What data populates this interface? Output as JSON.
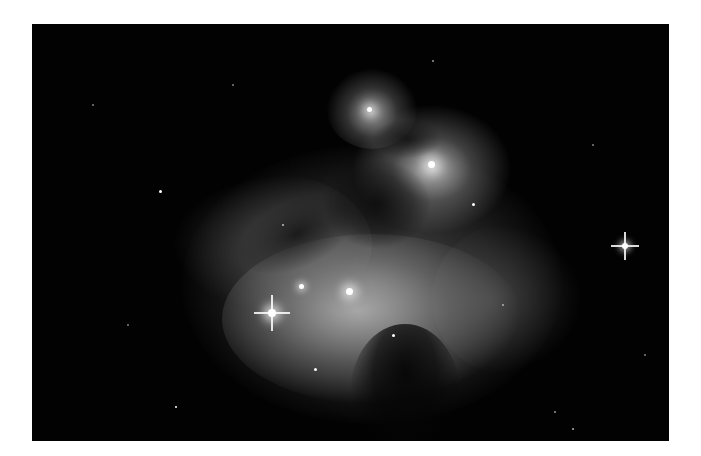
{
  "image": {
    "subject": "reflection/emission nebula with stars",
    "alt": "Grayscale astrophotograph of a nebula with bright stars",
    "colors": {
      "background": "#020202",
      "nebula_glow": "#bdbdbd",
      "page": "#ffffff"
    },
    "bright_stars": [
      {
        "x": 240,
        "y": 289,
        "size": 5,
        "spikes": true
      },
      {
        "x": 593,
        "y": 222,
        "size": 5,
        "spikes": true
      },
      {
        "x": 318,
        "y": 268,
        "size": 4,
        "spikes": false
      },
      {
        "x": 270,
        "y": 263,
        "size": 3,
        "spikes": false
      },
      {
        "x": 400,
        "y": 141,
        "size": 4,
        "spikes": false
      },
      {
        "x": 338,
        "y": 86,
        "size": 3,
        "spikes": false
      }
    ]
  }
}
